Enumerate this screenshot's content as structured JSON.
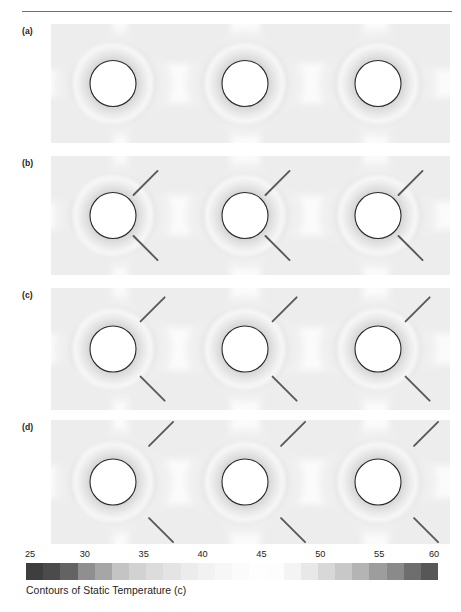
{
  "header": {
    "rule_color": "#6f6f6f",
    "text": ""
  },
  "figure": {
    "panel_bg": "#fbfbfb",
    "cylinder_fill": "#ffffff",
    "cylinder_stroke": "#2a2a2a",
    "fin_color": "#5a5a5a",
    "panels": [
      {
        "label": "(a)",
        "case": "bare-cylinders-no-fins",
        "fins": "none",
        "fin_gap": 0,
        "top": 24,
        "height": 119
      },
      {
        "label": "(b)",
        "case": "fins-attached-near-surface",
        "fins": "two-per-cylinder",
        "fin_gap": 4,
        "top": 156,
        "height": 119
      },
      {
        "label": "(c)",
        "case": "fins-intermediate-gap",
        "fins": "two-per-cylinder",
        "fin_gap": 14,
        "top": 288,
        "height": 122
      },
      {
        "label": "(d)",
        "case": "fins-largest-gap",
        "fins": "two-per-cylinder",
        "fin_gap": 26,
        "top": 420,
        "height": 124
      }
    ],
    "cylinder_centers_x": [
      113,
      245,
      378
    ],
    "cylinder_radius": 23
  },
  "colorbar": {
    "caption": "Contours of Static Temperature (c)",
    "unit": "c",
    "quantity": "Static Temperature",
    "ticks": [
      25,
      30,
      35,
      40,
      45,
      50,
      55,
      60
    ],
    "min": 25,
    "max": 60,
    "step": 5,
    "band_colors": [
      "#3e3e3e",
      "#4b4b4b",
      "#636363",
      "#8f8f8f",
      "#a6a6a6",
      "#c4c4c4",
      "#d2d2d2",
      "#dcdcdc",
      "#e4e4e4",
      "#ececec",
      "#f2f2f2",
      "#f7f7f7",
      "#fbfbfb",
      "#fefefe",
      "#fdfdfd",
      "#f4f4f4",
      "#e8e8e8",
      "#d8d8d8",
      "#c8c8c8",
      "#b4b4b4",
      "#9d9d9d",
      "#8a8a8a",
      "#6e6e6e",
      "#575757"
    ]
  },
  "watermark": {
    "text": ""
  },
  "chart_data": {
    "type": "heatmap",
    "title": "Contours of Static Temperature (c)",
    "subtitle": "Four cases (a)-(d): three horizontal heated cylinders in vertical array",
    "xlabel": "",
    "ylabel": "",
    "colorbar_label": "Contours of Static Temperature (c)",
    "colorbar_ticks": [
      25,
      30,
      35,
      40,
      45,
      50,
      55,
      60
    ],
    "value_range": [
      25,
      60
    ],
    "units": "c",
    "colormap": "grayscale-banded",
    "grid": false,
    "legend": "bottom-horizontal-colorbar",
    "panels": [
      {
        "label": "(a)",
        "description": "Bare cylinders without fins; thermal plumes merge between cylinders",
        "fin_count_per_cylinder": 0,
        "fin_gap_ratio": 0.0,
        "cylinder_count": 3,
        "peak_surface_temperature": 60,
        "ambient_temperature": 25
      },
      {
        "label": "(b)",
        "description": "Fins attached close to cylinder surface; small gap",
        "fin_count_per_cylinder": 2,
        "fin_gap_ratio": 0.1,
        "cylinder_count": 3,
        "peak_surface_temperature": 60,
        "ambient_temperature": 25
      },
      {
        "label": "(c)",
        "description": "Fins at intermediate gap from cylinder surface",
        "fin_count_per_cylinder": 2,
        "fin_gap_ratio": 0.3,
        "cylinder_count": 3,
        "peak_surface_temperature": 60,
        "ambient_temperature": 25
      },
      {
        "label": "(d)",
        "description": "Fins at largest gap from cylinder surface",
        "fin_count_per_cylinder": 2,
        "fin_gap_ratio": 0.5,
        "cylinder_count": 3,
        "peak_surface_temperature": 60,
        "ambient_temperature": 25
      }
    ]
  }
}
